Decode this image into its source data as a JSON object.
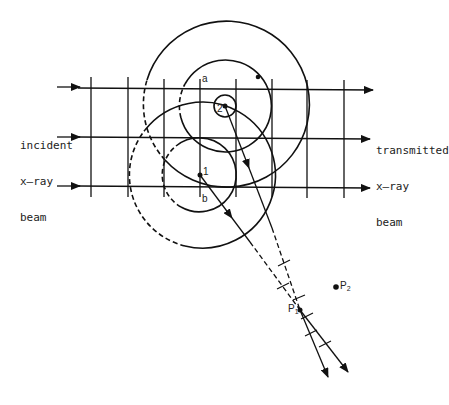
{
  "labels": {
    "incident": [
      "incident",
      "x–ray",
      "beam"
    ],
    "transmitted": [
      "transmitted",
      "x–ray",
      "beam"
    ],
    "point_a": "a",
    "point_b": "b",
    "point_1": "1",
    "point_2": "2",
    "P1": {
      "main": "P",
      "sub": "1"
    },
    "P2": {
      "main": "P",
      "sub": "2"
    }
  },
  "geometry": {
    "beams_y": [
      87,
      137,
      186
    ],
    "wavefronts_x": [
      91,
      128,
      164,
      200,
      236,
      272,
      307,
      344
    ],
    "scatterer_1": [
      200,
      175
    ],
    "scatterer_2": [
      225,
      106
    ],
    "P1": [
      300,
      310
    ],
    "P2": [
      336,
      287
    ]
  },
  "colors": {
    "ink": "#111111",
    "background": "#ffffff"
  }
}
